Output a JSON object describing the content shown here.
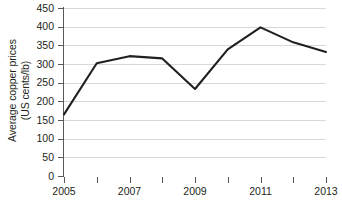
{
  "chart_data": {
    "type": "line",
    "title": "",
    "xlabel": "",
    "ylabel": "Average copper prices (US cents/lb)",
    "ylabel_line1": "Average copper prices",
    "ylabel_line2": "(US cents/lb)",
    "categories": [
      2005,
      2006,
      2007,
      2008,
      2009,
      2010,
      2011,
      2012,
      2013
    ],
    "x_tick_labels": [
      "2005",
      "",
      "2007",
      "",
      "2009",
      "",
      "2011",
      "",
      "2013"
    ],
    "values": [
      165,
      302,
      321,
      315,
      233,
      339,
      398,
      358,
      332
    ],
    "series": [
      {
        "name": "Average copper prices",
        "values": [
          165,
          302,
          321,
          315,
          233,
          339,
          398,
          358,
          332
        ]
      }
    ],
    "ylim": [
      0,
      450
    ],
    "xlim": [
      2005,
      2013
    ],
    "y_ticks": [
      0,
      50,
      100,
      150,
      200,
      250,
      300,
      350,
      400,
      450
    ],
    "y_tick_labels": [
      "0",
      "50",
      "100",
      "150",
      "200",
      "250",
      "300",
      "350",
      "400",
      "450"
    ],
    "grid": true,
    "grid_axis": "y",
    "legend": false,
    "legend_position": "none",
    "line_color": "#231f20",
    "grid_color": "#d8d8d8",
    "axis_color": "#58595b",
    "background_color": "#ffffff"
  }
}
